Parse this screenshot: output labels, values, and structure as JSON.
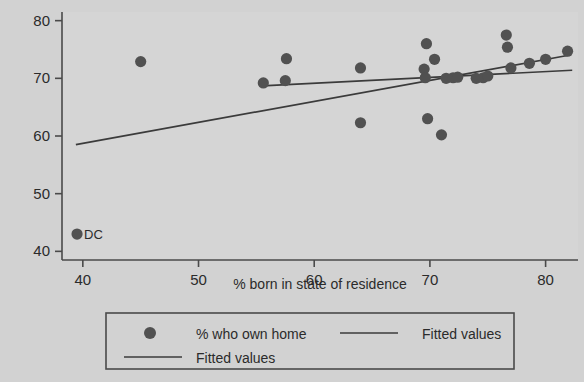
{
  "chart_data": {
    "type": "scatter",
    "title": "",
    "xlabel": "% born in state of residence",
    "ylabel": "",
    "xlim": [
      38.2,
      82.8
    ],
    "ylim": [
      38.5,
      81.5
    ],
    "xticks": [
      40,
      50,
      60,
      70,
      80
    ],
    "yticks": [
      40,
      50,
      60,
      70,
      80
    ],
    "grid": false,
    "legend_position": "bottom",
    "series": [
      {
        "name": "% who own home",
        "type": "scatter",
        "marker": "circle",
        "color": "#515151",
        "points": [
          {
            "x": 39.5,
            "y": 43.0,
            "label": "DC"
          },
          {
            "x": 45.0,
            "y": 72.9
          },
          {
            "x": 55.6,
            "y": 69.2
          },
          {
            "x": 57.5,
            "y": 69.6
          },
          {
            "x": 57.6,
            "y": 73.4
          },
          {
            "x": 64.0,
            "y": 71.8
          },
          {
            "x": 64.0,
            "y": 62.3
          },
          {
            "x": 69.5,
            "y": 71.6
          },
          {
            "x": 69.6,
            "y": 70.1
          },
          {
            "x": 69.7,
            "y": 76.0
          },
          {
            "x": 69.8,
            "y": 63.0
          },
          {
            "x": 70.4,
            "y": 73.3
          },
          {
            "x": 71.0,
            "y": 60.2
          },
          {
            "x": 71.4,
            "y": 70.0
          },
          {
            "x": 72.0,
            "y": 70.1
          },
          {
            "x": 72.4,
            "y": 70.2
          },
          {
            "x": 74.0,
            "y": 70.0
          },
          {
            "x": 74.6,
            "y": 70.1
          },
          {
            "x": 75.0,
            "y": 70.4
          },
          {
            "x": 76.6,
            "y": 77.5
          },
          {
            "x": 76.7,
            "y": 75.4
          },
          {
            "x": 77.0,
            "y": 71.8
          },
          {
            "x": 78.6,
            "y": 72.6
          },
          {
            "x": 80.0,
            "y": 73.3
          },
          {
            "x": 81.9,
            "y": 74.7
          }
        ]
      },
      {
        "name": "Fitted values",
        "type": "line",
        "color": "#3b3b3b",
        "note": "all observations including DC",
        "endpoints": [
          {
            "x": 39.4,
            "y": 58.5
          },
          {
            "x": 82.0,
            "y": 74.0
          }
        ]
      },
      {
        "name": "Fitted values",
        "type": "line",
        "color": "#3b3b3b",
        "note": "excluding DC outlier",
        "endpoints": [
          {
            "x": 55.5,
            "y": 68.7
          },
          {
            "x": 82.3,
            "y": 71.4
          }
        ]
      }
    ],
    "annotations": [
      {
        "text": "DC",
        "x": 39.5,
        "y": 43.0
      }
    ]
  },
  "legend": {
    "entries": [
      {
        "label": "% who own home",
        "kind": "marker"
      },
      {
        "label": "Fitted values",
        "kind": "line"
      },
      {
        "label": "Fitted values",
        "kind": "line"
      }
    ]
  },
  "colors": {
    "background": "#d2d2d2",
    "plot_background": "#d5d5d5",
    "marker": "#515151",
    "line": "#3b3b3b",
    "axis": "#4a4a4a",
    "text": "#2b2b2b"
  }
}
